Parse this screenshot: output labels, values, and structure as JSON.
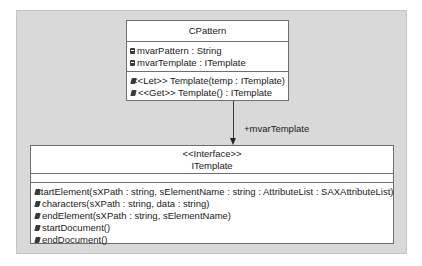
{
  "diagram": {
    "type": "UML class diagram",
    "classes": [
      {
        "id": "cpattern",
        "name": "CPattern",
        "stereotype": null,
        "attributes": [
          {
            "icon": "attribute-icon",
            "text": "mvarPattern : String"
          },
          {
            "icon": "attribute-icon",
            "text": "mvarTemplate : ITemplate"
          }
        ],
        "operations": [
          {
            "icon": "operation-icon",
            "text": "<<Let>> Template(temp : ITemplate)"
          },
          {
            "icon": "operation-icon",
            "text": "<<Get>> Template() : ITemplate"
          }
        ]
      },
      {
        "id": "itemplate",
        "name": "ITemplate",
        "stereotype": "<<Interface>>",
        "attributes": [],
        "operations": [
          {
            "icon": "operation-icon",
            "text": "startElement(sXPath : string, sElementName : string : AttributeList : SAXAttributeList)"
          },
          {
            "icon": "operation-icon",
            "text": "characters(sXPath : string, data : string)"
          },
          {
            "icon": "operation-icon",
            "text": "endElement(sXPath : string, sElementName)"
          },
          {
            "icon": "operation-icon",
            "text": "startDocument()"
          },
          {
            "icon": "operation-icon",
            "text": "endDocument()"
          }
        ]
      }
    ],
    "associations": [
      {
        "from": "CPattern",
        "to": "ITemplate",
        "label": "+mvarTemplate",
        "navigable": "to"
      }
    ]
  },
  "colors": {
    "canvas": "#d9d9d9",
    "box": "#ffffff",
    "border": "#6e6e6e",
    "text": "#1a1a1a"
  }
}
